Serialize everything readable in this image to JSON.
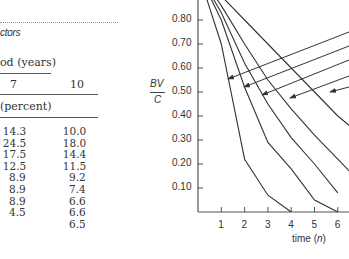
{
  "table": {
    "caption": "ctors",
    "header_group": "od  (years)",
    "columns": [
      "7",
      "10"
    ],
    "subheader": "(percent)",
    "rows": [
      [
        "14.3",
        "10.0"
      ],
      [
        "24.5",
        "18.0"
      ],
      [
        "17.5",
        "14.4"
      ],
      [
        "12.5",
        "11.5"
      ],
      [
        "8.9",
        "9.2"
      ],
      [
        "8.9",
        "7.4"
      ],
      [
        "8.9",
        "6.6"
      ],
      [
        "4.5",
        "6.6"
      ],
      [
        "",
        "6.5"
      ]
    ]
  },
  "chart_data": {
    "type": "line",
    "title": "",
    "ylabel_top": "BV",
    "ylabel_bottom": "C",
    "xlabel": "time (n)",
    "y_ticks": [
      "0.80",
      "0.70",
      "0.60",
      "0.50",
      "0.40",
      "0.30",
      "0.20",
      "0.10"
    ],
    "x_ticks": [
      "1",
      "2",
      "3",
      "4",
      "5",
      "6"
    ],
    "ylim": [
      0,
      0.9
    ],
    "xlim": [
      0,
      6.5
    ],
    "series": [
      {
        "name": "curve-1",
        "x": [
          0,
          1,
          2,
          3,
          4
        ],
        "y": [
          1.0,
          0.7,
          0.22,
          0.07,
          0.0
        ]
      },
      {
        "name": "curve-2",
        "x": [
          0,
          1,
          2,
          3,
          4,
          5,
          6
        ],
        "y": [
          1.0,
          0.8,
          0.52,
          0.29,
          0.18,
          0.05,
          0.0
        ]
      },
      {
        "name": "curve-3",
        "x": [
          0,
          1,
          2,
          3,
          4,
          5,
          6
        ],
        "y": [
          1.0,
          0.83,
          0.62,
          0.45,
          0.31,
          0.2,
          0.08
        ]
      },
      {
        "name": "curve-4",
        "x": [
          0,
          1,
          2,
          3,
          4,
          5,
          6,
          6.5
        ],
        "y": [
          1.0,
          0.86,
          0.7,
          0.55,
          0.43,
          0.32,
          0.22,
          0.17
        ]
      },
      {
        "name": "curve-5",
        "x": [
          0,
          1,
          2,
          3,
          4,
          5,
          6,
          6.5
        ],
        "y": [
          1.0,
          0.9,
          0.8,
          0.7,
          0.6,
          0.5,
          0.4,
          0.36
        ]
      }
    ],
    "annotations": "five arrows pointing from the right edge to each curve",
    "grid": false
  }
}
